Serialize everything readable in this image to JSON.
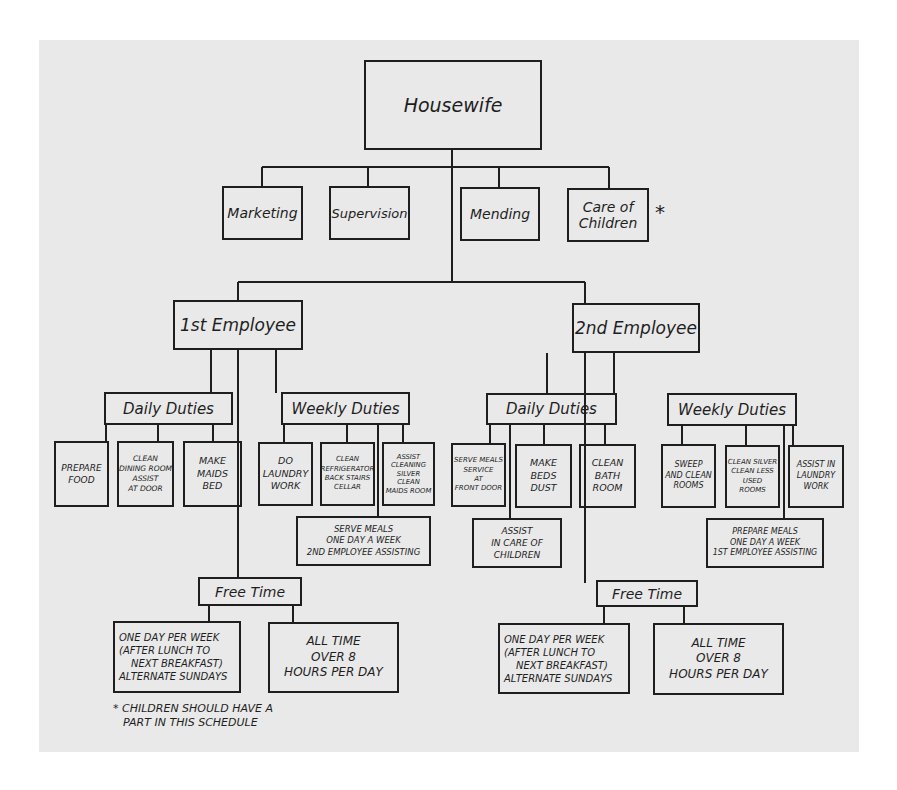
{
  "root": {
    "label": "Housewife"
  },
  "housewife_duties": [
    {
      "label": "Marketing"
    },
    {
      "label": "Supervision"
    },
    {
      "label": "Mending"
    },
    {
      "label": "Care of Children",
      "lines": [
        "Care of",
        "Children"
      ],
      "marker": "*"
    }
  ],
  "employees": [
    {
      "label": "1st Employee",
      "daily": {
        "label": "Daily Duties",
        "items": [
          {
            "lines": [
              "PREPARE",
              "FOOD"
            ]
          },
          {
            "lines": [
              "CLEAN",
              "DINING ROOM",
              "ASSIST",
              "AT DOOR"
            ]
          },
          {
            "lines": [
              "MAKE",
              "MAIDS",
              "BED"
            ]
          }
        ]
      },
      "weekly": {
        "label": "Weekly Duties",
        "items": [
          {
            "lines": [
              "DO",
              "LAUNDRY",
              "WORK"
            ]
          },
          {
            "lines": [
              "CLEAN",
              "REFRIGERATOR",
              "BACK STAIRS",
              "CELLAR"
            ]
          },
          {
            "lines": [
              "ASSIST",
              "CLEANING",
              "SILVER",
              "CLEAN",
              "MAIDS ROOM"
            ]
          }
        ],
        "extra": {
          "lines": [
            "SERVE MEALS",
            "ONE DAY A WEEK",
            "2ND EMPLOYEE ASSISTING"
          ]
        }
      },
      "free_time": {
        "label": "Free Time",
        "items": [
          {
            "lines": [
              "ONE DAY PER WEEK",
              "(AFTER LUNCH TO",
              "NEXT BREAKFAST)",
              "ALTERNATE SUNDAYS"
            ]
          },
          {
            "lines": [
              "ALL TIME",
              "OVER 8",
              "HOURS PER DAY"
            ]
          }
        ]
      }
    },
    {
      "label": "2nd Employee",
      "daily": {
        "label": "Daily Duties",
        "items": [
          {
            "lines": [
              "SERVE MEALS",
              "SERVICE",
              "AT",
              "FRONT DOOR"
            ]
          },
          {
            "lines": [
              "MAKE",
              "BEDS",
              "DUST"
            ]
          },
          {
            "lines": [
              "CLEAN",
              "BATH",
              "ROOM"
            ]
          }
        ],
        "extra": {
          "lines": [
            "ASSIST",
            "IN CARE OF",
            "CHILDREN"
          ]
        }
      },
      "weekly": {
        "label": "Weekly Duties",
        "items": [
          {
            "lines": [
              "SWEEP",
              "AND CLEAN",
              "ROOMS"
            ]
          },
          {
            "lines": [
              "CLEAN SILVER",
              "CLEAN LESS",
              "USED",
              "ROOMS"
            ]
          },
          {
            "lines": [
              "ASSIST IN",
              "LAUNDRY",
              "WORK"
            ]
          }
        ],
        "extra": {
          "lines": [
            "PREPARE MEALS",
            "ONE DAY A WEEK",
            "1ST EMPLOYEE ASSISTING"
          ]
        }
      },
      "free_time": {
        "label": "Free Time",
        "items": [
          {
            "lines": [
              "ONE DAY PER WEEK",
              "(AFTER LUNCH TO",
              "NEXT BREAKFAST)",
              "ALTERNATE SUNDAYS"
            ]
          },
          {
            "lines": [
              "ALL TIME",
              "OVER 8",
              "HOURS PER DAY"
            ]
          }
        ]
      }
    }
  ],
  "footnote": {
    "marker": "*",
    "lines": [
      "* CHILDREN SHOULD HAVE A",
      "PART IN THIS SCHEDULE"
    ]
  }
}
